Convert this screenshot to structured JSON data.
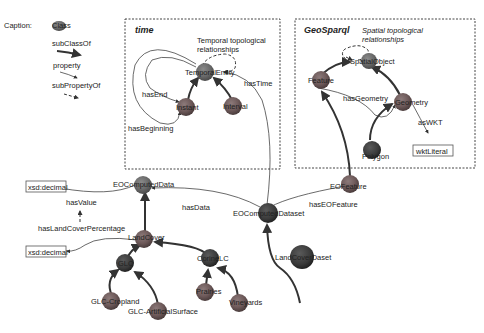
{
  "caption": {
    "label": "Caption:",
    "class_label": "Class",
    "subclass_label": "subClassOf",
    "property_label": "property",
    "subproperty_label": "subPropertyOf"
  },
  "time_panel": {
    "title": "time",
    "note_line1": "Temporal topological",
    "note_line2": "relationships",
    "nodes": {
      "temporal_entity": "TemporalEntity",
      "instant": "Instant",
      "interval": "Interval"
    },
    "edges": {
      "has_end": "hasEnd",
      "has_beginning": "hasBeginning",
      "has_time": "hasTime"
    }
  },
  "geo_panel": {
    "title": "GeoSparql",
    "note_line1": "Spatial topological",
    "note_line2": "relationships",
    "nodes": {
      "spatial_object": "SpatialObject",
      "feature": "Feature",
      "geometry": "Geometry",
      "polygon": "Polygon"
    },
    "edges": {
      "has_geometry": "hasGeometry",
      "as_wkt": "asWKT"
    },
    "literal": "wktLiteral"
  },
  "main": {
    "nodes": {
      "eo_computed_data": "EOComputedData",
      "eo_computed_dataset": "EOComputedDataset",
      "eo_feature": "EOFeature",
      "land_cover": "LandCover",
      "land_cover_dataset": "LandCoverDaset",
      "glc": "GLC",
      "corine_lc": "CorineLC",
      "glc_cropland": "GLC-Cropland",
      "glc_artificial_surface": "GLC-ArtificialSurface",
      "prairies": "Prairies",
      "vineyards": "Vineyards"
    },
    "edges": {
      "has_value": "hasValue",
      "has_land_cover_percentage": "hasLandCoverPercentage",
      "has_data": "hasData",
      "has_eo_feature": "hasEOFeature"
    },
    "literals": {
      "decimal_top": "xsd:decimal",
      "decimal_bottom": "xsd:decimal"
    }
  },
  "colors": {
    "node_fill": "#7a7a7a",
    "node_dark": "#3a3a3a",
    "node_mid": "#5a5a5a",
    "accent_red": "#8a4a4a"
  }
}
